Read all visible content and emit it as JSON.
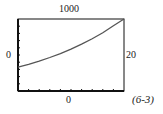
{
  "chart_data": {
    "type": "line",
    "title": "",
    "xlabel": "",
    "ylabel": "",
    "xlim": [
      0,
      20
    ],
    "ylim": [
      0,
      1000
    ],
    "x_ticks": 10,
    "y_ticks": 10,
    "grid": false,
    "series": [
      {
        "name": "curve",
        "x": [
          0,
          2,
          4,
          6,
          8,
          10,
          12,
          14,
          16,
          18,
          20
        ],
        "y": [
          330,
          370,
          415,
          465,
          520,
          580,
          650,
          725,
          810,
          905,
          1000
        ]
      }
    ],
    "annotations": [
      "(6-3)"
    ]
  },
  "labels": {
    "ymax": "1000",
    "ymin": "0",
    "xmax": "20",
    "xmin": "0",
    "reference": "(6-3)"
  },
  "colors": {
    "frame": "#111111",
    "curve": "#555555"
  }
}
